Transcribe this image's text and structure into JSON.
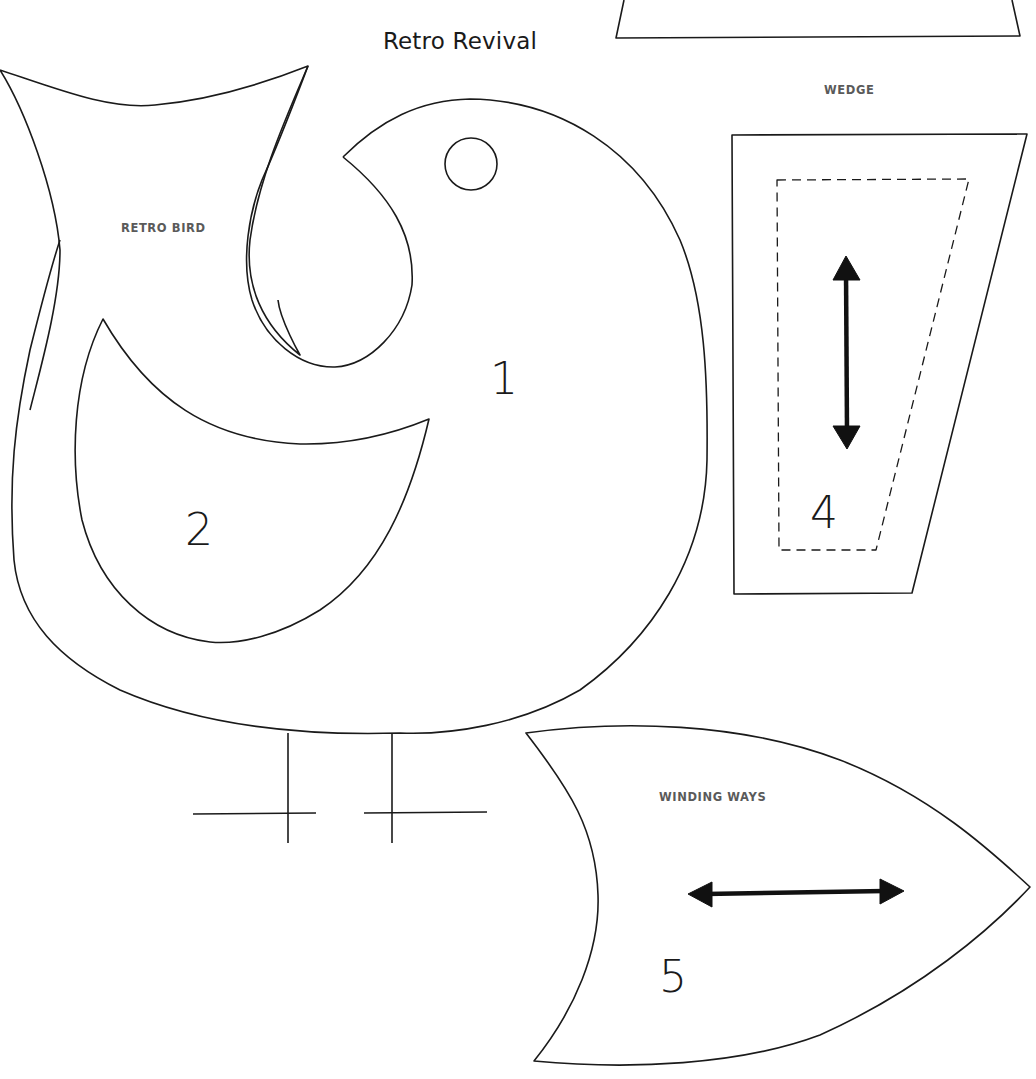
{
  "page": {
    "title": "Retro Revival"
  },
  "templates": [
    {
      "id": "retro-bird",
      "label": "RETRO BIRD",
      "pieces": [
        {
          "number": "1",
          "name": "bird-body"
        },
        {
          "number": "2",
          "name": "bird-wing"
        }
      ],
      "features": [
        "tail",
        "eye",
        "legs"
      ]
    },
    {
      "id": "wedge",
      "label": "WEDGE",
      "pieces": [
        {
          "number": "4",
          "name": "wedge-piece",
          "grain": "vertical",
          "has_seam_allowance": true
        }
      ]
    },
    {
      "id": "winding-ways",
      "label": "WINDING WAYS",
      "pieces": [
        {
          "number": "5",
          "name": "winding-ways-piece",
          "grain": "horizontal"
        }
      ]
    }
  ],
  "colors": {
    "line": "#1a1a1a",
    "label": "#5a5a5a",
    "background": "#ffffff"
  }
}
